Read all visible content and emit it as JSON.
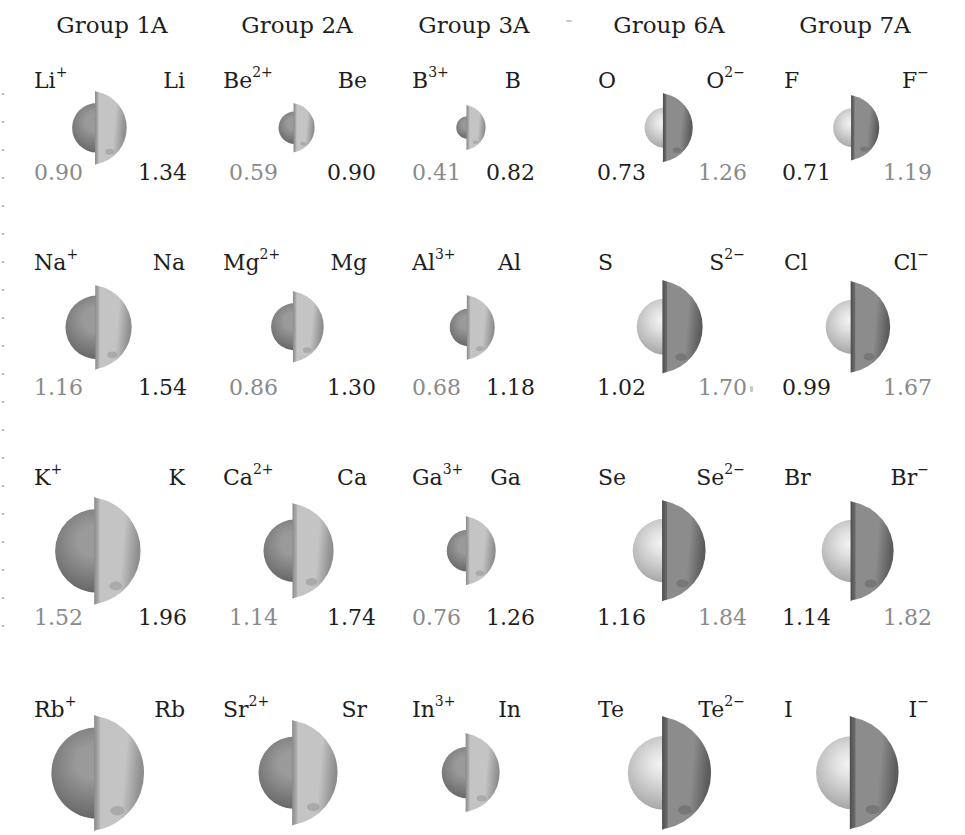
{
  "units": "Å",
  "groups": [
    {
      "label": "Group 1A",
      "type": "cation"
    },
    {
      "label": "Group 2A",
      "type": "cation"
    },
    {
      "label": "Group 3A",
      "type": "cation"
    },
    {
      "label": "Group 6A",
      "type": "anion"
    },
    {
      "label": "Group 7A",
      "type": "anion"
    }
  ],
  "colors": {
    "text_dark": "#1e1e1e",
    "text_grey": "#8a8a8a",
    "ion_cation_sphere": "#7d7d7d",
    "atom_shell_light": "#a8a8a8",
    "atom_sphere_light": "#bdbdbd",
    "anion_shell_dark": "#777777"
  },
  "rows": [
    [
      {
        "left": {
          "sym": "Li",
          "sup": "+",
          "r": "0.90"
        },
        "right": {
          "sym": "Li",
          "sup": "",
          "r": "1.34"
        }
      },
      {
        "left": {
          "sym": "Be",
          "sup": "2+",
          "r": "0.59"
        },
        "right": {
          "sym": "Be",
          "sup": "",
          "r": "0.90"
        }
      },
      {
        "left": {
          "sym": "B",
          "sup": "3+",
          "r": "0.41"
        },
        "right": {
          "sym": "B",
          "sup": "",
          "r": "0.82"
        }
      },
      {
        "left": {
          "sym": "O",
          "sup": "",
          "r": "0.73"
        },
        "right": {
          "sym": "O",
          "sup": "2−",
          "r": "1.26"
        }
      },
      {
        "left": {
          "sym": "F",
          "sup": "",
          "r": "0.71"
        },
        "right": {
          "sym": "F",
          "sup": "−",
          "r": "1.19"
        }
      }
    ],
    [
      {
        "left": {
          "sym": "Na",
          "sup": "+",
          "r": "1.16"
        },
        "right": {
          "sym": "Na",
          "sup": "",
          "r": "1.54"
        }
      },
      {
        "left": {
          "sym": "Mg",
          "sup": "2+",
          "r": "0.86"
        },
        "right": {
          "sym": "Mg",
          "sup": "",
          "r": "1.30"
        }
      },
      {
        "left": {
          "sym": "Al",
          "sup": "3+",
          "r": "0.68"
        },
        "right": {
          "sym": "Al",
          "sup": "",
          "r": "1.18"
        }
      },
      {
        "left": {
          "sym": "S",
          "sup": "",
          "r": "1.02"
        },
        "right": {
          "sym": "S",
          "sup": "2−",
          "r": "1.70"
        }
      },
      {
        "left": {
          "sym": "Cl",
          "sup": "",
          "r": "0.99"
        },
        "right": {
          "sym": "Cl",
          "sup": "−",
          "r": "1.67"
        }
      }
    ],
    [
      {
        "left": {
          "sym": "K",
          "sup": "+",
          "r": "1.52"
        },
        "right": {
          "sym": "K",
          "sup": "",
          "r": "1.96"
        }
      },
      {
        "left": {
          "sym": "Ca",
          "sup": "2+",
          "r": "1.14"
        },
        "right": {
          "sym": "Ca",
          "sup": "",
          "r": "1.74"
        }
      },
      {
        "left": {
          "sym": "Ga",
          "sup": "3+",
          "r": "0.76"
        },
        "right": {
          "sym": "Ga",
          "sup": "",
          "r": "1.26"
        }
      },
      {
        "left": {
          "sym": "Se",
          "sup": "",
          "r": "1.16"
        },
        "right": {
          "sym": "Se",
          "sup": "2−",
          "r": "1.84"
        }
      },
      {
        "left": {
          "sym": "Br",
          "sup": "",
          "r": "1.14"
        },
        "right": {
          "sym": "Br",
          "sup": "−",
          "r": "1.82"
        }
      }
    ],
    [
      {
        "left": {
          "sym": "Rb",
          "sup": "+",
          "r": null
        },
        "right": {
          "sym": "Rb",
          "sup": "",
          "r": null
        }
      },
      {
        "left": {
          "sym": "Sr",
          "sup": "2+",
          "r": null
        },
        "right": {
          "sym": "Sr",
          "sup": "",
          "r": null
        }
      },
      {
        "left": {
          "sym": "In",
          "sup": "3+",
          "r": null
        },
        "right": {
          "sym": "In",
          "sup": "",
          "r": null
        }
      },
      {
        "left": {
          "sym": "Te",
          "sup": "",
          "r": null
        },
        "right": {
          "sym": "Te",
          "sup": "2−",
          "r": null
        }
      },
      {
        "left": {
          "sym": "I",
          "sup": "",
          "r": null
        },
        "right": {
          "sym": "I",
          "sup": "−",
          "r": null
        }
      }
    ]
  ]
}
